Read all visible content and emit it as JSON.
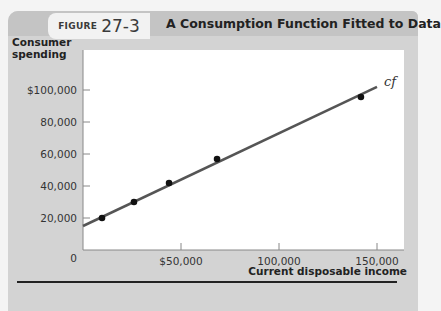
{
  "figure": {
    "label": "FIGURE",
    "number": "27-3",
    "title": "A Consumption Function Fitted to Data"
  },
  "axes": {
    "y_label_line1": "Consumer",
    "y_label_line2": "spending",
    "x_label": "Current disposable income",
    "y_ticks": [
      "$100,000",
      "80,000",
      "60,000",
      "40,000",
      "20,000",
      "0"
    ],
    "x_ticks": [
      "$50,000",
      "100,000",
      "150,000"
    ]
  },
  "line_label": "cf",
  "colors": {
    "panel": "#d3d3d3",
    "header": "#c4c4c4",
    "plot_bg": "#ffffff",
    "line": "#555555",
    "points": "#111111"
  },
  "chart_data": {
    "type": "scatter",
    "title": "A Consumption Function Fitted to Data",
    "subtitle": "FIGURE 27-3",
    "xlabel": "Current disposable income",
    "ylabel": "Consumer spending",
    "xlim": [
      0,
      160000
    ],
    "ylim": [
      0,
      110000
    ],
    "x_ticks": [
      50000,
      100000,
      150000
    ],
    "y_ticks": [
      0,
      20000,
      40000,
      60000,
      80000,
      100000
    ],
    "grid": false,
    "series": [
      {
        "name": "Household data",
        "type": "scatter",
        "x": [
          9700,
          26000,
          43900,
          68400,
          141800
        ],
        "y": [
          20000,
          30000,
          41900,
          56900,
          95600
        ]
      },
      {
        "name": "cf",
        "type": "line",
        "x": [
          0,
          150000
        ],
        "y": [
          15000,
          102000
        ]
      }
    ],
    "annotations": [
      {
        "text": "cf",
        "x": 152000,
        "y": 104000
      }
    ]
  }
}
